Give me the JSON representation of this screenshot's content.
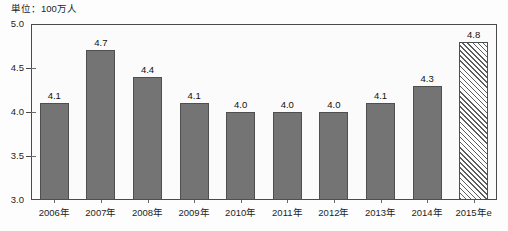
{
  "chart_data": {
    "type": "bar",
    "title": "単位：100万人",
    "xlabel": "",
    "ylabel": "",
    "ylim": [
      3.0,
      5.0
    ],
    "ytick_labels": [
      "5.0",
      "4.5",
      "4.0",
      "3.5",
      "3.0"
    ],
    "ytick_values": [
      5.0,
      4.5,
      4.0,
      3.5,
      3.0
    ],
    "grid": false,
    "legend": "none",
    "categories": [
      "2006年",
      "2007年",
      "2008年",
      "2009年",
      "2010年",
      "2011年",
      "2012年",
      "2013年",
      "2014年",
      "2015年e"
    ],
    "values": [
      4.1,
      4.7,
      4.4,
      4.1,
      4.0,
      4.0,
      4.0,
      4.1,
      4.3,
      4.8
    ],
    "value_labels": [
      "4.1",
      "4.7",
      "4.4",
      "4.1",
      "4.0",
      "4.0",
      "4.0",
      "4.1",
      "4.3",
      "4.8"
    ],
    "bar_styles": [
      "solid",
      "solid",
      "solid",
      "solid",
      "solid",
      "solid",
      "solid",
      "solid",
      "solid",
      "hatched"
    ],
    "colors": {
      "bar_fill": "#747474",
      "bar_stroke": "#4f4f4f",
      "estimate_hatch": "#5d5d5d",
      "plot_background": "#fbfbfb",
      "axis": "#4a4a4a",
      "text": "#1d1d1d"
    },
    "annotations": [
      "最終バー（2015年e）はハッチング＝推計値"
    ]
  }
}
